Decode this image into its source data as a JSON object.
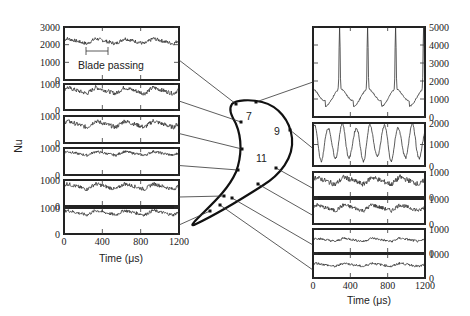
{
  "chart_data": {
    "type": "line",
    "title": "",
    "ylabel": "Nu",
    "xlabel": "Time (μs)",
    "annotation": "Blade passing",
    "blade_labels": [
      "7",
      "9",
      "11"
    ],
    "x_ticks": [
      "0",
      "400",
      "800",
      "1200"
    ],
    "xlim": [
      0,
      1200
    ],
    "left_panels": [
      {
        "ylim": [
          0,
          3000
        ],
        "yticks": [
          "0",
          "1000",
          "2000",
          "3000"
        ],
        "mean": 2200,
        "amp": 250,
        "peaks": 4,
        "note": "Blade passing"
      },
      {
        "ylim": [
          0,
          1000
        ],
        "yticks": [
          "0",
          "1000"
        ],
        "mean": 750,
        "amp": 200,
        "peaks": 4
      },
      {
        "ylim": [
          0,
          1000
        ],
        "yticks": [
          "0",
          "1000"
        ],
        "mean": 700,
        "amp": 200,
        "peaks": 4
      },
      {
        "ylim": [
          0,
          1000
        ],
        "yticks": [
          "0",
          "1000"
        ],
        "mean": 800,
        "amp": 120,
        "peaks": 4
      },
      {
        "ylim": [
          0,
          1000
        ],
        "yticks": [
          "0",
          "1000"
        ],
        "mean": 750,
        "amp": 180,
        "peaks": 4
      },
      {
        "ylim": [
          0,
          1000
        ],
        "yticks": [
          "0",
          "1000"
        ],
        "mean": 820,
        "amp": 150,
        "peaks": 4
      }
    ],
    "right_panels": [
      {
        "ylim": [
          0,
          5000
        ],
        "yticks": [
          "0",
          "1000",
          "2000",
          "3000",
          "4000",
          "5000"
        ],
        "mean": 1000,
        "peak": 4600,
        "peaks": 4
      },
      {
        "ylim": [
          0,
          2000
        ],
        "yticks": [
          "0",
          "1000",
          "2000"
        ],
        "mean": 1100,
        "amp": 900,
        "peaks": 8
      },
      {
        "ylim": [
          0,
          1000
        ],
        "yticks": [
          "0",
          "1000"
        ],
        "mean": 650,
        "amp": 250,
        "peaks": 4
      },
      {
        "ylim": [
          0,
          1000
        ],
        "yticks": [
          "0",
          "1000"
        ],
        "mean": 650,
        "amp": 200,
        "peaks": 4
      },
      {
        "ylim": [
          0,
          1000
        ],
        "yticks": [
          "0",
          "1000"
        ],
        "mean": 550,
        "amp": 120,
        "peaks": 4
      },
      {
        "ylim": [
          0,
          1000
        ],
        "yticks": [
          "0",
          "1000"
        ],
        "mean": 550,
        "amp": 120,
        "peaks": 4
      }
    ]
  },
  "labels": {
    "ylabel": "Nu",
    "xlabel_left": "Time (μs)",
    "xlabel_right": "Time (μs)",
    "annotation": "Blade passing",
    "blade_7": "7",
    "blade_9": "9",
    "blade_11": "11"
  }
}
